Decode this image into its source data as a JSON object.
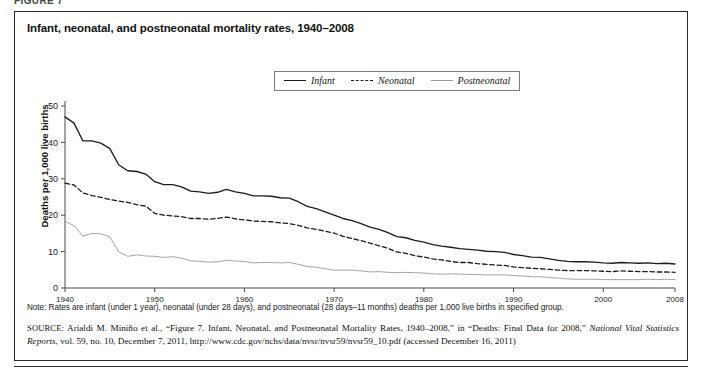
{
  "page": {
    "top_partial_caption": "FIGURE 7"
  },
  "figure": {
    "title": "Infant, neonatal, and postneonatal mortality rates, 1940–2008",
    "note": "Note: Rates are infant (under 1 year), neonatal (under 28 days), and postneonatal (28 days–11 months) deaths per 1,000 live births in specified group.",
    "source_label": "SOURCE:",
    "source_text_1": "Arialdi M. Miniño et al., “Figure 7. Infant, Neonatal, and Postneonatal Mortality Rates, 1940–2008,” in “Deaths: Final Data for 2008,” ",
    "source_italic_1": "National Vital Statistics Reports",
    "source_text_2": ", vol. 59, no. 10, December 7, 2011, http://www.cdc.gov/nchs/data/nvsr/nvsr59/nvsr59_10.pdf (accessed December 16, 2011)"
  },
  "legend": {
    "position": "top-center",
    "items": [
      {
        "label": "Infant",
        "style": "solid",
        "color": "#1d1d1d"
      },
      {
        "label": "Neonatal",
        "style": "dashed",
        "color": "#1d1d1d"
      },
      {
        "label": "Postneonatal",
        "style": "solid-thin",
        "color": "#9a9a9a"
      }
    ]
  },
  "chart_data": {
    "type": "line",
    "title": "Infant, neonatal, and postneonatal mortality rates, 1940–2008",
    "xlabel": "",
    "ylabel": "Deaths per 1,000 live births",
    "xlim": [
      1940,
      2008
    ],
    "ylim": [
      0,
      50
    ],
    "ytick_values": [
      0,
      10,
      20,
      30,
      40,
      50
    ],
    "ytick_labels": [
      "0",
      "10",
      "20",
      "30",
      "40",
      "50"
    ],
    "xtick_values": [
      1940,
      1950,
      1960,
      1970,
      1980,
      1990,
      2000,
      2008
    ],
    "xtick_labels": [
      "1940",
      "1950",
      "1960",
      "1970",
      "1980",
      "1990",
      "2000",
      "2008"
    ],
    "grid": false,
    "x": [
      1940,
      1941,
      1942,
      1943,
      1944,
      1945,
      1946,
      1947,
      1948,
      1949,
      1950,
      1951,
      1952,
      1953,
      1954,
      1955,
      1956,
      1957,
      1958,
      1959,
      1960,
      1961,
      1962,
      1963,
      1964,
      1965,
      1966,
      1967,
      1968,
      1969,
      1970,
      1971,
      1972,
      1973,
      1974,
      1975,
      1976,
      1977,
      1978,
      1979,
      1980,
      1981,
      1982,
      1983,
      1984,
      1985,
      1986,
      1987,
      1988,
      1989,
      1990,
      1991,
      1992,
      1993,
      1994,
      1995,
      1996,
      1997,
      1998,
      1999,
      2000,
      2001,
      2002,
      2003,
      2004,
      2005,
      2006,
      2007,
      2008
    ],
    "series": [
      {
        "name": "Infant",
        "style": "solid",
        "color": "#1d1d1d",
        "values": [
          47.0,
          45.3,
          40.4,
          40.4,
          39.8,
          38.3,
          33.8,
          32.2,
          32.0,
          31.3,
          29.2,
          28.4,
          28.4,
          27.8,
          26.6,
          26.4,
          26.0,
          26.3,
          27.1,
          26.4,
          26.0,
          25.3,
          25.3,
          25.2,
          24.8,
          24.7,
          23.7,
          22.4,
          21.8,
          20.9,
          20.0,
          19.1,
          18.5,
          17.7,
          16.7,
          16.1,
          15.2,
          14.1,
          13.8,
          13.1,
          12.6,
          11.9,
          11.5,
          11.2,
          10.8,
          10.6,
          10.4,
          10.1,
          10.0,
          9.8,
          9.2,
          8.9,
          8.5,
          8.4,
          8.0,
          7.6,
          7.3,
          7.2,
          7.2,
          7.1,
          6.9,
          6.8,
          7.0,
          6.9,
          6.8,
          6.9,
          6.7,
          6.8,
          6.6
        ]
      },
      {
        "name": "Neonatal",
        "style": "dashed",
        "color": "#1d1d1d",
        "values": [
          28.8,
          28.3,
          26.1,
          25.4,
          24.9,
          24.3,
          23.9,
          23.5,
          22.9,
          22.5,
          20.5,
          20.0,
          19.8,
          19.6,
          19.1,
          19.1,
          18.9,
          19.1,
          19.5,
          19.0,
          18.7,
          18.4,
          18.3,
          18.2,
          17.9,
          17.7,
          17.2,
          16.5,
          16.1,
          15.6,
          15.1,
          14.2,
          13.6,
          13.0,
          12.3,
          11.6,
          10.9,
          9.9,
          9.5,
          8.9,
          8.5,
          8.0,
          7.7,
          7.3,
          7.0,
          7.0,
          6.7,
          6.5,
          6.3,
          6.2,
          5.8,
          5.6,
          5.4,
          5.3,
          5.1,
          4.9,
          4.8,
          4.8,
          4.8,
          4.7,
          4.6,
          4.5,
          4.7,
          4.6,
          4.5,
          4.5,
          4.4,
          4.4,
          4.3
        ]
      },
      {
        "name": "Postneonatal",
        "style": "solid-thin",
        "color": "#9a9a9a",
        "values": [
          18.3,
          17.1,
          14.3,
          15.0,
          14.9,
          14.0,
          9.9,
          8.7,
          9.1,
          8.8,
          8.7,
          8.4,
          8.6,
          8.2,
          7.5,
          7.3,
          7.1,
          7.2,
          7.6,
          7.4,
          7.3,
          6.9,
          7.0,
          7.0,
          6.9,
          7.0,
          6.5,
          5.9,
          5.7,
          5.3,
          4.9,
          4.9,
          4.9,
          4.7,
          4.4,
          4.5,
          4.3,
          4.2,
          4.3,
          4.2,
          4.1,
          3.9,
          3.8,
          3.9,
          3.8,
          3.7,
          3.7,
          3.6,
          3.6,
          3.6,
          3.4,
          3.3,
          3.1,
          3.1,
          2.9,
          2.7,
          2.5,
          2.4,
          2.4,
          2.4,
          2.3,
          2.3,
          2.3,
          2.3,
          2.3,
          2.4,
          2.3,
          2.4,
          2.3
        ]
      }
    ]
  }
}
